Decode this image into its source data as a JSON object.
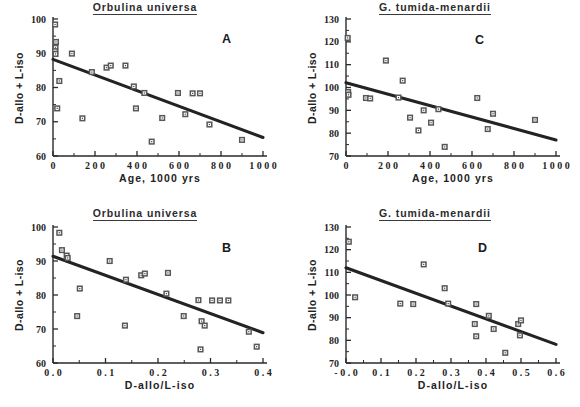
{
  "figure": {
    "panels": [
      {
        "key": "A",
        "label": "A",
        "title": "Orbulina  universa",
        "xlabel": "Age,  1000  yrs",
        "ylabel": "D-allo + L-iso"
      },
      {
        "key": "C",
        "label": "C",
        "title": "G.  tumida-menardii",
        "xlabel": "Age,  1000  yrs",
        "ylabel": "D-allo + L-iso"
      },
      {
        "key": "B",
        "label": "B",
        "title": "Orbulina  universa",
        "xlabel": "D-allo/L-iso",
        "ylabel": "D-allo + L-iso"
      },
      {
        "key": "D",
        "label": "D",
        "title": "G.  tumida-menardii",
        "xlabel": "D-allo/L-iso",
        "ylabel": "D-allo + L-iso"
      }
    ]
  },
  "chart_data": [
    {
      "type": "scatter",
      "panel": "A",
      "title": "Orbulina  universa",
      "xlabel": "Age,  1000  yrs",
      "ylabel": "D-allo + L-iso",
      "xlim": [
        0,
        1000
      ],
      "ylim": [
        60,
        100
      ],
      "xticks": [
        0,
        200,
        400,
        600,
        800,
        1000
      ],
      "xticklabels": [
        "0",
        "2 0 0",
        "4 0 0",
        "6 0 0",
        "8 0 0",
        "1 0 0 0"
      ],
      "yticks": [
        60,
        70,
        80,
        90,
        100
      ],
      "yticklabels": [
        "60",
        "70",
        "80",
        "90",
        "100"
      ],
      "minor_xticks": [
        100,
        300,
        500,
        700,
        900
      ],
      "minor_yticks": [
        65,
        75,
        85,
        95
      ],
      "grid": false,
      "legend": null,
      "marker": "open-square",
      "points": [
        {
          "x": 10,
          "y": 98.4
        },
        {
          "x": 14,
          "y": 93.3
        },
        {
          "x": 12,
          "y": 91.6
        },
        {
          "x": 10,
          "y": 90.6
        },
        {
          "x": 12,
          "y": 89.8
        },
        {
          "x": 90,
          "y": 89.9
        },
        {
          "x": 30,
          "y": 81.9
        },
        {
          "x": 20,
          "y": 73.9
        },
        {
          "x": 140,
          "y": 71.0
        },
        {
          "x": 185,
          "y": 84.5
        },
        {
          "x": 255,
          "y": 85.8
        },
        {
          "x": 275,
          "y": 86.4
        },
        {
          "x": 345,
          "y": 86.4
        },
        {
          "x": 385,
          "y": 80.3
        },
        {
          "x": 395,
          "y": 73.9
        },
        {
          "x": 435,
          "y": 78.4
        },
        {
          "x": 470,
          "y": 64.2
        },
        {
          "x": 520,
          "y": 71.1
        },
        {
          "x": 595,
          "y": 78.4
        },
        {
          "x": 630,
          "y": 72.2
        },
        {
          "x": 665,
          "y": 78.3
        },
        {
          "x": 700,
          "y": 78.3
        },
        {
          "x": 745,
          "y": 69.2
        },
        {
          "x": 900,
          "y": 64.7
        }
      ],
      "fit_line": {
        "x0": 0,
        "y0": 88.2,
        "x1": 1000,
        "y1": 65.4
      }
    },
    {
      "type": "scatter",
      "panel": "C",
      "title": "G.  tumida-menardii",
      "xlabel": "Age,  1000  yrs",
      "ylabel": "D-allo + L-iso",
      "xlim": [
        0,
        1000
      ],
      "ylim": [
        70,
        130
      ],
      "xticks": [
        0,
        200,
        400,
        600,
        800,
        1000
      ],
      "xticklabels": [
        "0",
        "2 0 0",
        "4 0 0",
        "6 0 0",
        "8 0 0",
        "1 0 0 0"
      ],
      "yticks": [
        70,
        80,
        90,
        100,
        110,
        120,
        130
      ],
      "yticklabels": [
        "70",
        "80",
        "90",
        "100",
        "110",
        "120",
        "130"
      ],
      "minor_xticks": [
        100,
        300,
        500,
        700,
        900
      ],
      "minor_yticks": [
        75,
        85,
        95,
        105,
        115,
        125
      ],
      "grid": false,
      "legend": null,
      "marker": "open-square",
      "points": [
        {
          "x": 8,
          "y": 121.7
        },
        {
          "x": 10,
          "y": 98.0
        },
        {
          "x": 12,
          "y": 96.8
        },
        {
          "x": 95,
          "y": 95.4
        },
        {
          "x": 115,
          "y": 95.2
        },
        {
          "x": 190,
          "y": 111.8
        },
        {
          "x": 270,
          "y": 103.0
        },
        {
          "x": 250,
          "y": 95.6
        },
        {
          "x": 305,
          "y": 86.8
        },
        {
          "x": 345,
          "y": 81.2
        },
        {
          "x": 370,
          "y": 90.0
        },
        {
          "x": 405,
          "y": 84.6
        },
        {
          "x": 440,
          "y": 90.5
        },
        {
          "x": 470,
          "y": 74.0
        },
        {
          "x": 625,
          "y": 95.4
        },
        {
          "x": 675,
          "y": 81.8
        },
        {
          "x": 700,
          "y": 88.5
        },
        {
          "x": 900,
          "y": 85.8
        }
      ],
      "fit_line": {
        "x0": 0,
        "y0": 102.1,
        "x1": 1000,
        "y1": 77.0
      }
    },
    {
      "type": "scatter",
      "panel": "B",
      "title": "Orbulina  universa",
      "xlabel": "D-allo/L-iso",
      "ylabel": "D-allo + L-iso",
      "xlim": [
        0.0,
        0.4
      ],
      "ylim": [
        60,
        100
      ],
      "xticks": [
        0.0,
        0.1,
        0.2,
        0.3,
        0.4
      ],
      "xticklabels": [
        "0 . 0",
        "0 . 1",
        "0 . 2",
        "0 . 3",
        "0 . 4"
      ],
      "yticks": [
        60,
        70,
        80,
        90,
        100
      ],
      "yticklabels": [
        "60",
        "70",
        "80",
        "90",
        "100"
      ],
      "minor_xticks": [
        0.05,
        0.15,
        0.25,
        0.35
      ],
      "minor_yticks": [
        65,
        75,
        85,
        95
      ],
      "grid": false,
      "legend": null,
      "marker": "open-square",
      "points": [
        {
          "x": 0.012,
          "y": 98.3
        },
        {
          "x": 0.017,
          "y": 93.2
        },
        {
          "x": 0.026,
          "y": 91.6
        },
        {
          "x": 0.028,
          "y": 90.9
        },
        {
          "x": 0.108,
          "y": 90.0
        },
        {
          "x": 0.051,
          "y": 81.9
        },
        {
          "x": 0.046,
          "y": 73.8
        },
        {
          "x": 0.137,
          "y": 71.0
        },
        {
          "x": 0.139,
          "y": 84.5
        },
        {
          "x": 0.168,
          "y": 85.8
        },
        {
          "x": 0.175,
          "y": 86.3
        },
        {
          "x": 0.219,
          "y": 86.5
        },
        {
          "x": 0.216,
          "y": 80.4
        },
        {
          "x": 0.249,
          "y": 73.8
        },
        {
          "x": 0.277,
          "y": 78.5
        },
        {
          "x": 0.283,
          "y": 72.3
        },
        {
          "x": 0.289,
          "y": 71.0
        },
        {
          "x": 0.281,
          "y": 64.0
        },
        {
          "x": 0.303,
          "y": 78.4
        },
        {
          "x": 0.318,
          "y": 78.4
        },
        {
          "x": 0.334,
          "y": 78.4
        },
        {
          "x": 0.373,
          "y": 69.2
        },
        {
          "x": 0.388,
          "y": 64.8
        }
      ],
      "fit_line": {
        "x0": 0.0,
        "y0": 91.4,
        "x1": 0.4,
        "y1": 68.9
      }
    },
    {
      "type": "scatter",
      "panel": "D",
      "title": "G.  tumida-menardii",
      "xlabel": "D-allo/L-iso",
      "ylabel": "D-allo + L-iso",
      "xlim": [
        -0.0,
        0.6
      ],
      "ylim": [
        70,
        130
      ],
      "xticks": [
        0.0,
        0.1,
        0.2,
        0.3,
        0.4,
        0.5,
        0.6
      ],
      "xticklabels": [
        "- 0 . 0",
        "0 . 1",
        "0 . 2",
        "0 . 3",
        "0 . 4",
        "0 . 5",
        "0 . 6"
      ],
      "yticks": [
        70,
        80,
        90,
        100,
        110,
        120,
        130
      ],
      "yticklabels": [
        "70",
        "80",
        "90",
        "100",
        "110",
        "120",
        "130"
      ],
      "minor_xticks": [
        0.05,
        0.15,
        0.25,
        0.35,
        0.45,
        0.55
      ],
      "minor_yticks": [
        75,
        85,
        95,
        105,
        115,
        125
      ],
      "grid": false,
      "legend": null,
      "marker": "open-square",
      "points": [
        {
          "x": 0.008,
          "y": 123.5
        },
        {
          "x": 0.026,
          "y": 99.0
        },
        {
          "x": 0.155,
          "y": 96.2
        },
        {
          "x": 0.192,
          "y": 96.0
        },
        {
          "x": 0.222,
          "y": 113.5
        },
        {
          "x": 0.282,
          "y": 103.0
        },
        {
          "x": 0.292,
          "y": 96.2
        },
        {
          "x": 0.368,
          "y": 87.2
        },
        {
          "x": 0.372,
          "y": 81.8
        },
        {
          "x": 0.372,
          "y": 96.0
        },
        {
          "x": 0.408,
          "y": 90.8
        },
        {
          "x": 0.422,
          "y": 85.0
        },
        {
          "x": 0.455,
          "y": 74.5
        },
        {
          "x": 0.492,
          "y": 87.2
        },
        {
          "x": 0.5,
          "y": 88.8
        },
        {
          "x": 0.497,
          "y": 82.2
        }
      ],
      "fit_line": {
        "x0": -0.0,
        "y0": 112.0,
        "x1": 0.6,
        "y1": 78.2
      }
    }
  ]
}
